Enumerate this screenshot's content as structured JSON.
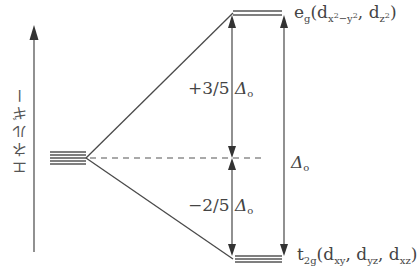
{
  "diagram": {
    "axis_label": "エネルギー",
    "upper_level": {
      "name": "e_g",
      "main": "e",
      "main_sub": "g",
      "orbitals_open": "(d",
      "orb1_sub": "x",
      "orb1_sup1": "2",
      "orb1_mid": "−y",
      "orb1_sup2": "2",
      "sep": ", d",
      "orb2_sub": "z",
      "orb2_sup": "2",
      "close": ")"
    },
    "lower_level": {
      "name": "t_2g",
      "main": "t",
      "main_sub": "2g",
      "open": "(d",
      "o1": "xy",
      "sep1": ", d",
      "o2": "yz",
      "sep2": ", d",
      "o3": "xz",
      "close": ")"
    },
    "upper_shift": {
      "sign_frac": "+3/5 ",
      "delta": "Δ",
      "delta_sub": "o"
    },
    "lower_shift": {
      "sign_frac": "−2/5 ",
      "delta": "Δ",
      "delta_sub": "o"
    },
    "total_split": {
      "delta": "Δ",
      "delta_sub": "o"
    },
    "degenerate_lines": 5,
    "eg_lines": 2,
    "t2g_lines": 3,
    "colors": {
      "line": "#4a4a4a",
      "text": "#444444"
    }
  }
}
